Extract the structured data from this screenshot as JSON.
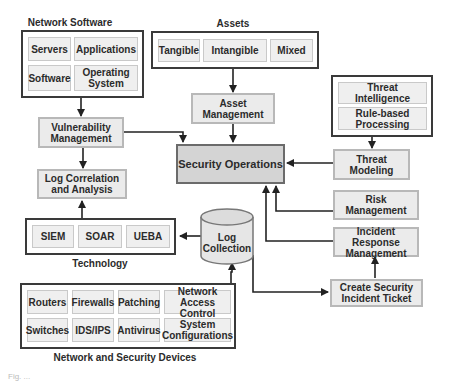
{
  "groups": {
    "network_software": {
      "title": "Network Software",
      "items": [
        "Servers",
        "Applications",
        "Software",
        "Operating System"
      ]
    },
    "assets": {
      "title": "Assets",
      "items": [
        "Tangible",
        "Intangible",
        "Mixed"
      ]
    },
    "threat_sources": {
      "items": [
        "Threat Intelligence",
        "Rule-based Processing"
      ]
    },
    "technology": {
      "title": "Technology",
      "items": [
        "SIEM",
        "SOAR",
        "UEBA"
      ]
    },
    "devices": {
      "title": "Network and Security Devices",
      "items": [
        "Routers",
        "Firewalls",
        "Patching",
        "Network Access Control",
        "Switches",
        "IDS/IPS",
        "Antivirus",
        "System Configurations"
      ]
    }
  },
  "nodes": {
    "asset_management": "Asset Management",
    "security_operations": "Security Operations",
    "vulnerability_management": "Vulnerability Management",
    "log_correlation": "Log Correlation and Analysis",
    "threat_modeling": "Threat Modeling",
    "risk_management": "Risk Management",
    "incident_response": "Incident Response Management",
    "create_ticket": "Create Security Incident Ticket",
    "log_collection": "Log Collection"
  },
  "caption": "Fig. ..."
}
